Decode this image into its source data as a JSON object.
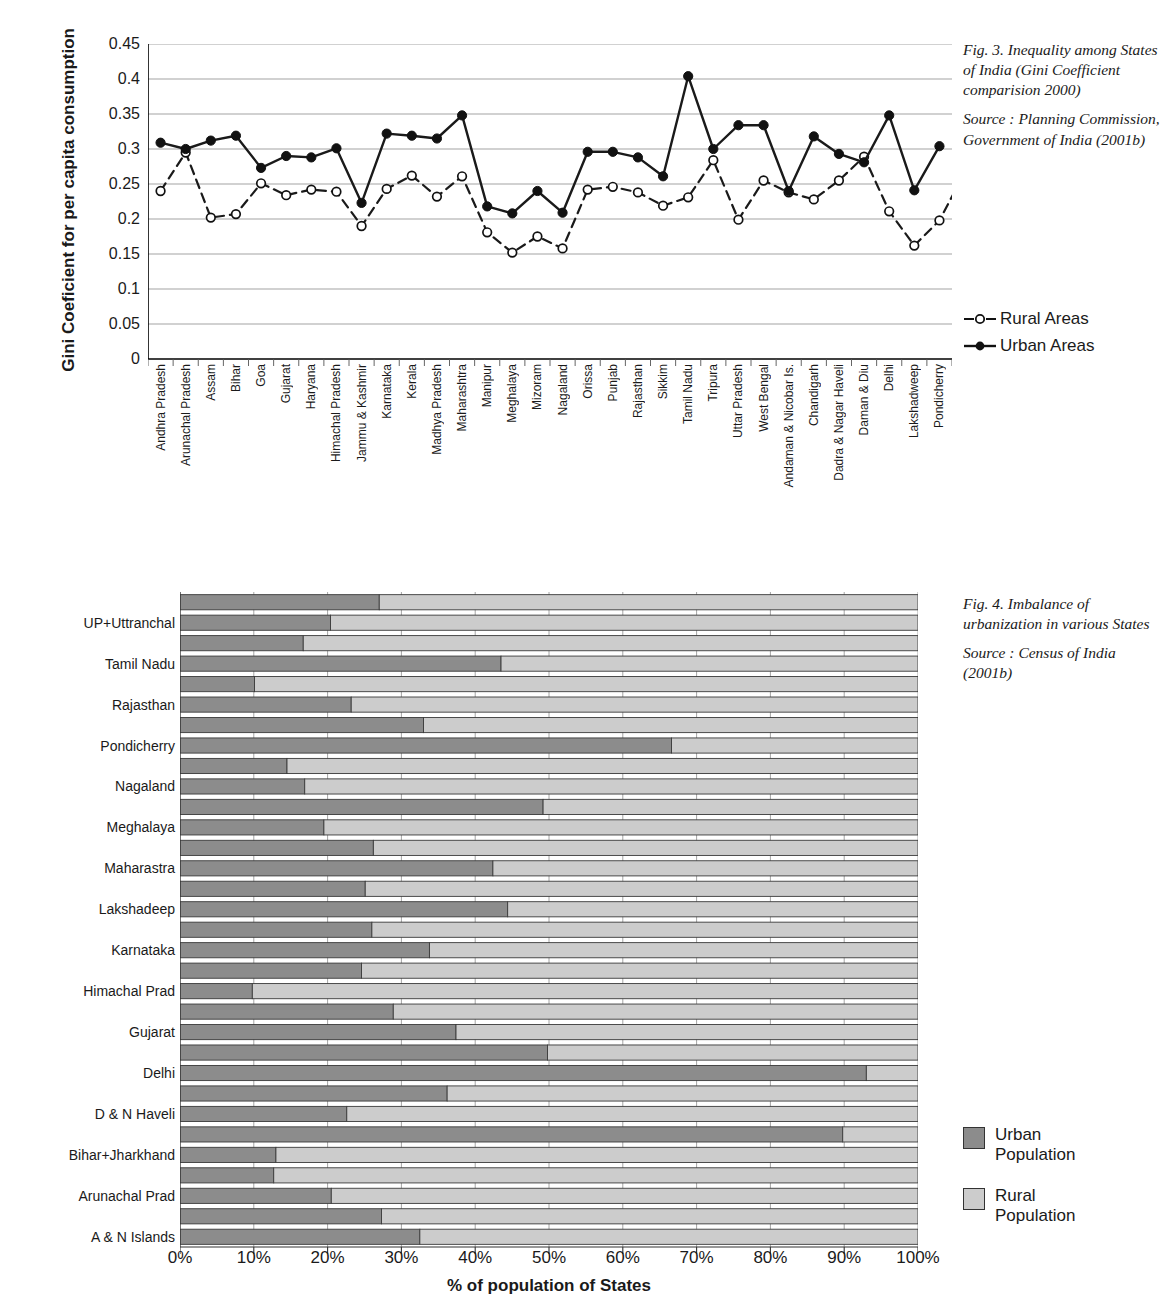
{
  "fig3": {
    "ylabel": "Gini Coeficient for per capita consumption",
    "caption_lines": [
      "Fig. 3. Inequality among States of India (Gini Coefficient comparision 2000)",
      "Source : Planning Commission, Government of India (2001b)"
    ],
    "legend": [
      {
        "name": "rural-areas",
        "label": "Rural Areas",
        "style": "dashed-open-circle"
      },
      {
        "name": "urban-areas",
        "label": "Urban Areas",
        "style": "solid-filled-circle"
      }
    ]
  },
  "fig4": {
    "caption_lines": [
      "Fig. 4. Imbalance of urbanization in various States",
      "Source : Census of India (2001b)"
    ],
    "xtitle": "% of population of States",
    "legend": [
      {
        "name": "urban-population",
        "label": "Urban Population",
        "color": "#8c8c8c"
      },
      {
        "name": "rural-population",
        "label": "Rural Population",
        "color": "#cccccc"
      }
    ]
  },
  "chart_data": [
    {
      "type": "line",
      "title": "Fig. 3. Inequality among States of India (Gini Coefficient comparision 2000)",
      "xlabel": "",
      "ylabel": "Gini Coeficient for per capita consumption",
      "ylim": [
        0,
        0.45
      ],
      "yticks": [
        0,
        0.05,
        0.1,
        0.15,
        0.2,
        0.25,
        0.3,
        0.35,
        0.4,
        0.45
      ],
      "ytick_labels": [
        "0",
        "0.05",
        "0.1",
        "0.15",
        "0.2",
        "0.25",
        "0.3",
        "0.35",
        "0.4",
        "0.45"
      ],
      "grid": true,
      "legend_position": "right",
      "categories": [
        "Andhra Pradesh",
        "Arunachal Pradesh",
        "Assam",
        "Bihar",
        "Goa",
        "Gujarat",
        "Haryana",
        "Himachal Pradesh",
        "Jammu & Kashmir",
        "Karnataka",
        "Kerala",
        "Madhya Pradesh",
        "Maharashtra",
        "Manipur",
        "Meghalaya",
        "Mizoram",
        "Nagaland",
        "Orissa",
        "Punjab",
        "Rajasthan",
        "Sikkim",
        "Tamil Nadu",
        "Tripura",
        "Uttar Pradesh",
        "West Bengal",
        "Andaman & Nicobar Is.",
        "Chandigarh",
        "Dadra & Nagar Haveli",
        "Daman & Diu",
        "Delhi",
        "Lakshadweep",
        "Pondicherry"
      ],
      "series": [
        {
          "name": "Rural Areas",
          "marker": "open-circle",
          "linestyle": "dashed",
          "values": [
            0.24,
            0.295,
            0.202,
            0.207,
            0.251,
            0.234,
            0.242,
            0.239,
            0.19,
            0.243,
            0.262,
            0.232,
            0.261,
            0.181,
            0.152,
            0.175,
            0.158,
            0.242,
            0.246,
            0.238,
            0.219,
            0.231,
            0.284,
            0.199,
            0.255,
            0.238,
            0.228,
            0.255,
            0.289,
            0.211,
            0.162,
            0.198,
            0.266
          ]
        },
        {
          "name": "Urban Areas",
          "marker": "filled-circle",
          "linestyle": "solid",
          "values": [
            0.309,
            0.3,
            0.312,
            0.319,
            0.273,
            0.29,
            0.288,
            0.301,
            0.223,
            0.322,
            0.319,
            0.315,
            0.348,
            0.218,
            0.208,
            0.24,
            0.209,
            0.296,
            0.296,
            0.288,
            0.261,
            0.404,
            0.3,
            0.334,
            0.334,
            0.24,
            0.318,
            0.293,
            0.281,
            0.348,
            0.241,
            0.304
          ]
        }
      ]
    },
    {
      "type": "bar",
      "orientation": "horizontal",
      "stacked": true,
      "title": "Fig. 4. Imbalance of urbanization in various States",
      "xlabel": "% of population of States",
      "ylabel": "",
      "xlim": [
        0,
        100
      ],
      "xticks": [
        0,
        10,
        20,
        30,
        40,
        50,
        60,
        70,
        80,
        90,
        100
      ],
      "xtick_labels": [
        "0%",
        "10%",
        "20%",
        "30%",
        "40%",
        "50%",
        "60%",
        "70%",
        "80%",
        "90%",
        "100%"
      ],
      "grid": true,
      "legend_position": "right",
      "categories": [
        "West Bengal",
        "UP+Uttranchal",
        "Tripura",
        "Tamil Nadu",
        "Sikkim",
        "Rajasthan",
        "Punjab",
        "Pondicherry",
        "Orissa",
        "Nagaland",
        "Mizoram",
        "Meghalaya",
        "Manipur",
        "Maharastra",
        "M P + Chhattisgarh",
        "Lakshadeep",
        "Kerala",
        "Karnataka",
        "J & K",
        "Himachal Prad",
        "Haryana",
        "Gujarat",
        "Goa",
        "Delhi",
        "Daman & Diu",
        "D & N Haveli",
        "Chandigarh",
        "Bihar+Jharkhand",
        "Assam",
        "Arunachal Prad",
        "Andhra Pradesh",
        "A & N Islands"
      ],
      "series": [
        {
          "name": "Urban Population",
          "color": "#8c8c8c",
          "values": [
            27.0,
            20.4,
            16.7,
            43.5,
            10.1,
            23.2,
            33.0,
            66.6,
            14.5,
            16.9,
            49.2,
            19.5,
            26.2,
            42.4,
            25.1,
            44.4,
            26.0,
            33.8,
            24.6,
            9.8,
            28.9,
            37.4,
            49.8,
            93.0,
            36.2,
            22.6,
            89.8,
            13.0,
            12.7,
            20.5,
            27.3,
            32.5
          ]
        },
        {
          "name": "Rural Population",
          "color": "#cccccc",
          "values": [
            73.0,
            79.6,
            83.3,
            56.5,
            89.9,
            76.8,
            67.0,
            33.4,
            85.5,
            83.1,
            50.8,
            80.5,
            73.8,
            57.6,
            74.9,
            55.6,
            74.0,
            66.2,
            75.4,
            90.2,
            71.1,
            62.6,
            50.2,
            7.0,
            63.8,
            77.4,
            10.2,
            87.0,
            87.3,
            79.5,
            72.7,
            67.5
          ]
        }
      ]
    }
  ]
}
